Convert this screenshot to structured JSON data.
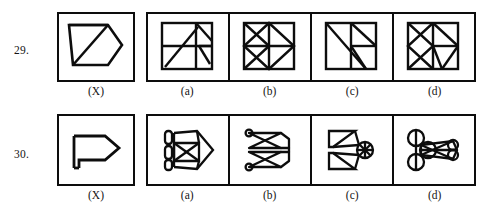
{
  "page": {
    "type": "figure-completion-puzzle",
    "ink_color": "#0d0d0d",
    "background_color": "#ffffff"
  },
  "questions": [
    {
      "number": "29.",
      "problem_label": "(X)",
      "problem_figure": "open-pentagon-arrow-outline",
      "options": [
        {
          "label": "(a)",
          "figure": "square-grid-with-diagonal-and-arrow"
        },
        {
          "label": "(b)",
          "figure": "square-grid-with-full-diagonals"
        },
        {
          "label": "(c)",
          "figure": "square-with-long-diagonal-and-quad-grid"
        },
        {
          "label": "(d)",
          "figure": "square-with-x-and-quad-grid"
        }
      ]
    },
    {
      "number": "30.",
      "problem_label": "(X)",
      "problem_figure": "thick-arrow-flag-outline",
      "options": [
        {
          "label": "(a)",
          "figure": "bars-with-boxed-x-and-diamond"
        },
        {
          "label": "(b)",
          "figure": "bowtie-loops-double"
        },
        {
          "label": "(c)",
          "figure": "double-wedge-with-circle"
        },
        {
          "label": "(d)",
          "figure": "triple-circle-with-elongated-spindle"
        }
      ]
    }
  ]
}
